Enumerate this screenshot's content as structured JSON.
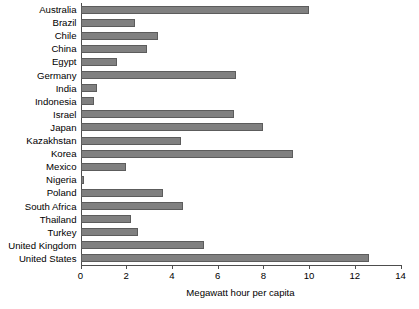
{
  "chart_data": {
    "type": "bar",
    "orientation": "horizontal",
    "title": "",
    "xlabel": "Megawatt hour per capita",
    "ylabel": "",
    "xlim": [
      0,
      14
    ],
    "xticks": [
      0,
      2,
      4,
      6,
      8,
      10,
      12,
      14
    ],
    "grid": false,
    "legend": null,
    "bar_color": "#808080",
    "bar_edge_color": "#5c5c5c",
    "axis_color": "#4d4d4d",
    "categories": [
      "Australia",
      "Brazil",
      "Chile",
      "China",
      "Egypt",
      "Germany",
      "India",
      "Indonesia",
      "Israel",
      "Japan",
      "Kazakhstan",
      "Korea",
      "Mexico",
      "Nigeria",
      "Poland",
      "South Africa",
      "Thailand",
      "Turkey",
      "United Kingdom",
      "United States"
    ],
    "values": [
      10.0,
      2.4,
      3.4,
      2.9,
      1.6,
      6.8,
      0.7,
      0.6,
      6.7,
      8.0,
      4.4,
      9.3,
      2.0,
      0.15,
      3.6,
      4.5,
      2.2,
      2.5,
      5.4,
      12.6
    ]
  }
}
